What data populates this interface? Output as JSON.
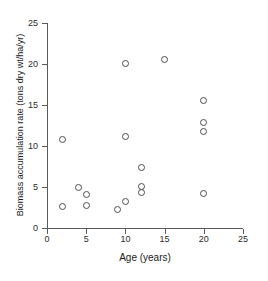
{
  "chart_data": {
    "type": "scatter",
    "title": "",
    "xlabel": "Age (years)",
    "ylabel": "Biomass accumulation rate (tons dry wt/ha/yr)",
    "xlim": [
      0,
      25
    ],
    "ylim": [
      0,
      25
    ],
    "xticks": [
      0,
      5,
      10,
      15,
      20,
      25
    ],
    "yticks": [
      0,
      5,
      10,
      15,
      20,
      25
    ],
    "xtick_labels": [
      "0",
      "5",
      "10",
      "15",
      "20",
      "25"
    ],
    "ytick_labels": [
      "0",
      "5",
      "10",
      "15",
      "20",
      "25"
    ],
    "grid": false,
    "legend": false,
    "marker": "open-circle",
    "marker_color": "#4d4d4d",
    "points": [
      {
        "x": 2,
        "y": 10.8
      },
      {
        "x": 2,
        "y": 2.6
      },
      {
        "x": 4,
        "y": 5.0
      },
      {
        "x": 5,
        "y": 4.1
      },
      {
        "x": 5,
        "y": 2.7
      },
      {
        "x": 9,
        "y": 2.2
      },
      {
        "x": 10,
        "y": 20.1
      },
      {
        "x": 10,
        "y": 11.2
      },
      {
        "x": 10,
        "y": 3.2
      },
      {
        "x": 12,
        "y": 7.4
      },
      {
        "x": 12,
        "y": 5.1
      },
      {
        "x": 12,
        "y": 4.3
      },
      {
        "x": 15,
        "y": 20.6
      },
      {
        "x": 20,
        "y": 15.6
      },
      {
        "x": 20,
        "y": 12.9
      },
      {
        "x": 20,
        "y": 11.8
      },
      {
        "x": 20,
        "y": 4.2
      }
    ]
  },
  "figure": {
    "clipped_caption": ""
  }
}
